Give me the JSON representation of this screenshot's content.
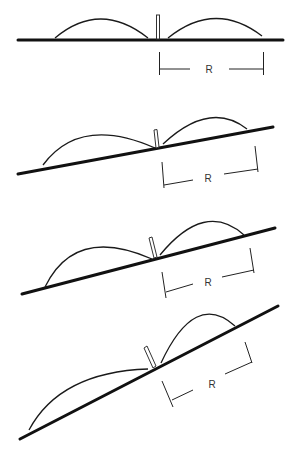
{
  "figure": {
    "colors": {
      "line": "#111111",
      "background": "#ffffff"
    },
    "panels": [
      {
        "id": "level",
        "dimension_label": "R"
      },
      {
        "id": "slight-slope",
        "dimension_label": "R"
      },
      {
        "id": "moderate-slope",
        "dimension_label": "R"
      },
      {
        "id": "steep-slope",
        "dimension_label": "R"
      }
    ]
  }
}
